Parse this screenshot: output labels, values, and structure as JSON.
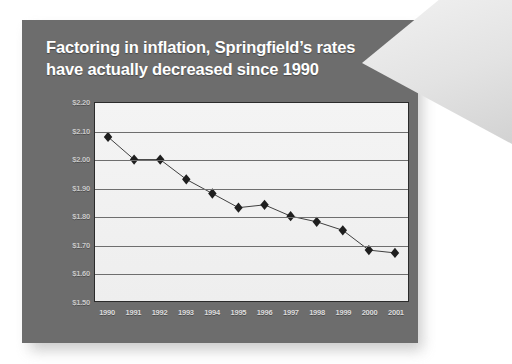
{
  "slide": {
    "title": "Factoring in inflation, Springfield’s rates have actually decreased since 1990",
    "background_color": "#6d6d6d",
    "title_color": "#ffffff",
    "peel_color": "#e8e8e8"
  },
  "chart_data": {
    "type": "line",
    "title": "Factoring in inflation, Springfield’s rates have actually decreased since 1990",
    "xlabel": "",
    "ylabel": "",
    "categories": [
      "1990",
      "1991",
      "1992",
      "1993",
      "1994",
      "1995",
      "1996",
      "1997",
      "1998",
      "1999",
      "2000",
      "2001"
    ],
    "values": [
      2.08,
      2.0,
      2.0,
      1.93,
      1.88,
      1.83,
      1.84,
      1.8,
      1.78,
      1.75,
      1.68,
      1.67
    ],
    "ytick_labels": [
      "$2.20",
      "$2.10",
      "$2.00",
      "$1.90",
      "$1.80",
      "$1.70",
      "$1.60",
      "$1.50"
    ],
    "ytick_values": [
      2.2,
      2.1,
      2.0,
      1.9,
      1.8,
      1.7,
      1.6,
      1.5
    ],
    "ylim": [
      1.5,
      2.2
    ],
    "grid": true,
    "legend": "none",
    "marker": "diamond",
    "line_color": "#2b2b2b",
    "marker_color": "#1f1f1f",
    "plot_background": "#f1f1f1",
    "gridline_color": "#6e6e6e",
    "tick_label_color": "#cfcfcf"
  }
}
